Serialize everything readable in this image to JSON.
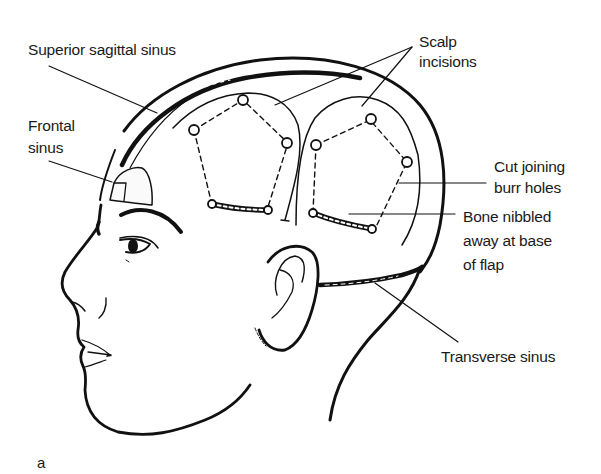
{
  "figure": {
    "panel_letter": "a",
    "labels": {
      "superior_sagittal_sinus": "Superior sagittal sinus",
      "frontal_sinus_line1": "Frontal",
      "frontal_sinus_line2": "sinus",
      "scalp_incisions_line1": "Scalp",
      "scalp_incisions_line2": "incisions",
      "cut_joining_line1": "Cut joining",
      "cut_joining_line2": "burr holes",
      "bone_nibbled_line1": "Bone nibbled",
      "bone_nibbled_line2": "away at base",
      "bone_nibbled_line3": "of flap",
      "transverse_sinus": "Transverse sinus"
    },
    "colors": {
      "ink": "#111111",
      "background": "#ffffff"
    }
  }
}
